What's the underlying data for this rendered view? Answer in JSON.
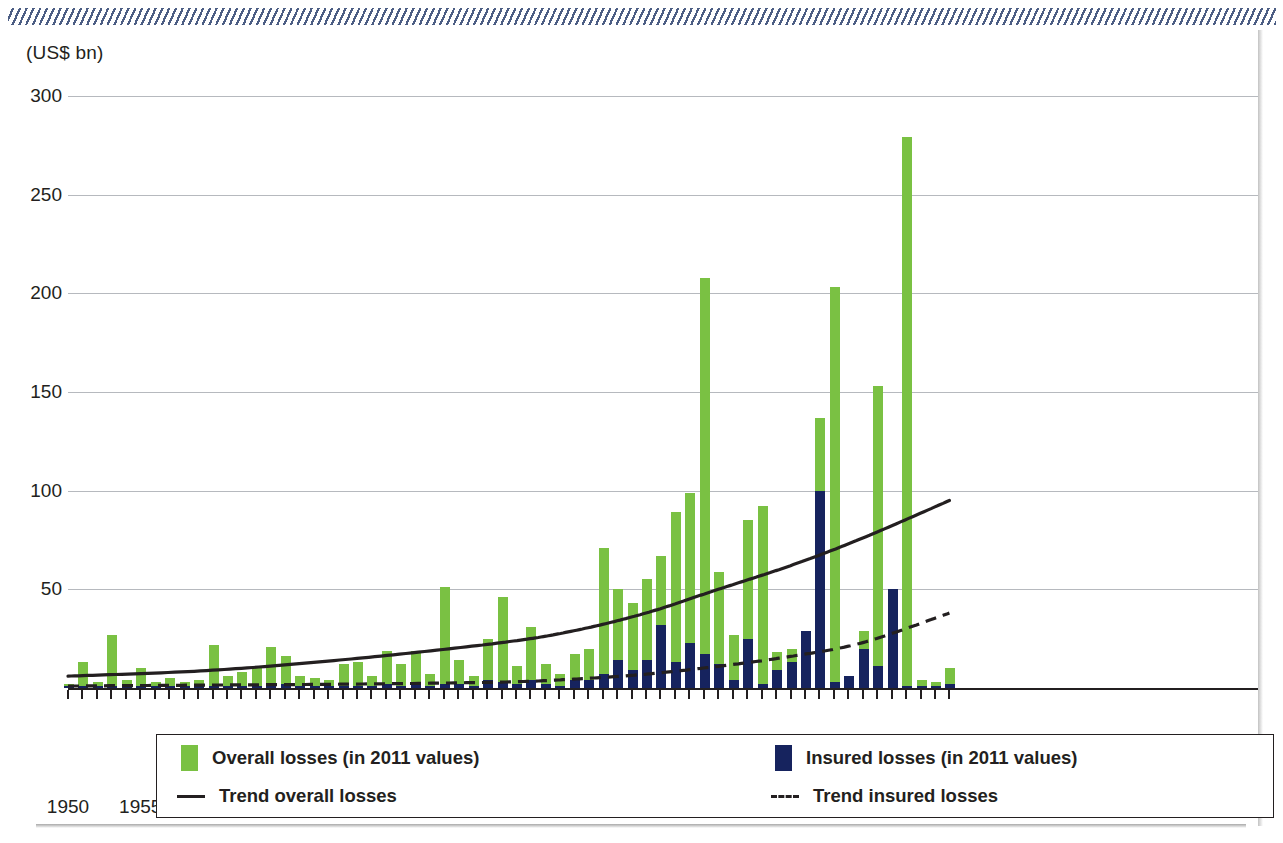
{
  "chart_data": {
    "type": "bar",
    "title": "",
    "subtitle": "",
    "xlabel": "",
    "ylabel": "(US$ bn)",
    "ylim": [
      0,
      300
    ],
    "xlim": [
      1950,
      2011
    ],
    "grid": true,
    "legend_position": "bottom",
    "y_ticks": [
      300,
      250,
      200,
      150,
      100,
      50
    ],
    "x_ticks": [
      1950,
      1955,
      1960,
      1965,
      1970,
      1975,
      1980,
      1985,
      1990,
      1995,
      2000,
      2005,
      2010
    ],
    "categories": [
      1950,
      1951,
      1952,
      1953,
      1954,
      1955,
      1956,
      1957,
      1958,
      1959,
      1960,
      1961,
      1962,
      1963,
      1964,
      1965,
      1966,
      1967,
      1968,
      1969,
      1970,
      1971,
      1972,
      1973,
      1974,
      1975,
      1976,
      1977,
      1978,
      1979,
      1980,
      1981,
      1982,
      1983,
      1984,
      1985,
      1986,
      1987,
      1988,
      1989,
      1990,
      1991,
      1992,
      1993,
      1994,
      1995,
      1996,
      1997,
      1998,
      1999,
      2000,
      2001,
      2002,
      2003,
      2004,
      2005,
      2006,
      2007,
      2008,
      2009,
      2010,
      2011
    ],
    "series": [
      {
        "name": "Overall losses (in 2011 values)",
        "color": "#7ac143",
        "values": [
          2,
          13,
          3,
          27,
          4,
          10,
          2,
          5,
          3,
          4,
          22,
          5,
          8,
          4,
          21,
          15,
          5,
          4,
          3,
          4,
          11,
          5,
          19,
          12,
          18,
          6,
          51,
          14,
          5,
          25,
          46,
          10,
          31,
          11,
          6,
          17,
          19,
          71,
          50,
          43,
          55,
          67,
          89,
          99,
          208,
          59,
          27,
          85,
          92,
          18,
          20,
          29,
          137,
          203,
          5,
          29,
          153,
          50,
          279,
          3,
          2,
          9
        ]
      },
      {
        "name": "Insured losses (in 2011 values)",
        "color": "#16235e",
        "values": [
          0,
          1,
          0,
          1,
          0,
          1,
          0,
          0,
          0,
          0,
          1,
          0,
          1,
          0,
          2,
          1,
          0,
          0,
          0,
          0,
          1,
          0,
          2,
          1,
          2,
          0,
          2,
          1,
          0,
          2,
          3,
          1,
          3,
          1,
          0,
          2,
          2,
          6,
          13,
          9,
          13,
          31,
          12,
          22,
          16,
          11,
          4,
          24,
          1,
          8,
          13,
          45,
          100,
          2,
          14,
          20,
          11,
          63,
          0,
          0,
          1,
          2
        ]
      }
    ],
    "series_note": "values are paired per category in categories order; insured is a sub-portion drawn inside the overall bar",
    "bars": [
      {
        "year": 1950,
        "overall": 2,
        "insured": 0
      },
      {
        "year": 1951,
        "overall": 13,
        "insured": 1
      },
      {
        "year": 1952,
        "overall": 3,
        "insured": 0
      },
      {
        "year": 1953,
        "overall": 27,
        "insured": 1
      },
      {
        "year": 1954,
        "overall": 4,
        "insured": 0
      },
      {
        "year": 1955,
        "overall": 10,
        "insured": 1
      },
      {
        "year": 1956,
        "overall": 2,
        "insured": 0
      },
      {
        "year": 1957,
        "overall": 5,
        "insured": 0
      },
      {
        "year": 1958,
        "overall": 3,
        "insured": 0
      },
      {
        "year": 1959,
        "overall": 4,
        "insured": 0
      },
      {
        "year": 1960,
        "overall": 22,
        "insured": 1
      },
      {
        "year": 1961,
        "overall": 5,
        "insured": 0
      },
      {
        "year": 1962,
        "overall": 8,
        "insured": 1
      },
      {
        "year": 1963,
        "overall": 10,
        "insured": 0
      },
      {
        "year": 1964,
        "overall": 21,
        "insured": 2
      },
      {
        "year": 1965,
        "overall": 16,
        "insured": 1
      },
      {
        "year": 1966,
        "overall": 5,
        "insured": 0
      },
      {
        "year": 1967,
        "overall": 4,
        "insured": 0
      },
      {
        "year": 1968,
        "overall": 3,
        "insured": 0
      },
      {
        "year": 1969,
        "overall": 11,
        "insured": 1
      },
      {
        "year": 1970,
        "overall": 12,
        "insured": 1
      },
      {
        "year": 1971,
        "overall": 5,
        "insured": 0
      },
      {
        "year": 1972,
        "overall": 19,
        "insured": 2
      },
      {
        "year": 1973,
        "overall": 12,
        "insured": 1
      },
      {
        "year": 1974,
        "overall": 19,
        "insured": 2
      },
      {
        "year": 1975,
        "overall": 6,
        "insured": 0
      },
      {
        "year": 1976,
        "overall": 51,
        "insured": 2
      },
      {
        "year": 1977,
        "overall": 14,
        "insured": 1
      },
      {
        "year": 1978,
        "overall": 5,
        "insured": 0
      },
      {
        "year": 1979,
        "overall": 25,
        "insured": 4
      },
      {
        "year": 1980,
        "overall": 46,
        "insured": 3
      },
      {
        "year": 1981,
        "overall": 10,
        "insured": 1
      },
      {
        "year": 1982,
        "overall": 31,
        "insured": 3
      },
      {
        "year": 1983,
        "overall": 12,
        "insured": 2
      },
      {
        "year": 1984,
        "overall": 6,
        "insured": 1
      },
      {
        "year": 1985,
        "overall": 17,
        "insured": 3
      },
      {
        "year": 1986,
        "overall": 19,
        "insured": 3
      },
      {
        "year": 1987,
        "overall": 71,
        "insured": 6
      },
      {
        "year": 1988,
        "overall": 50,
        "insured": 13
      },
      {
        "year": 1989,
        "overall": 43,
        "insured": 9
      },
      {
        "year": 1990,
        "overall": 55,
        "insured": 13
      },
      {
        "year": 1991,
        "overall": 67,
        "insured": 31
      },
      {
        "year": 1992,
        "overall": 89,
        "insured": 12
      },
      {
        "year": 1993,
        "overall": 99,
        "insured": 22
      },
      {
        "year": 1994,
        "overall": 208,
        "insured": 16
      },
      {
        "year": 1995,
        "overall": 59,
        "insured": 11
      },
      {
        "year": 1996,
        "overall": 27,
        "insured": 4
      },
      {
        "year": 1997,
        "overall": 85,
        "insured": 24
      },
      {
        "year": 1998,
        "overall": 92,
        "insured": 1
      },
      {
        "year": 1999,
        "overall": 18,
        "insured": 8
      },
      {
        "year": 2000,
        "overall": 20,
        "insured": 13
      },
      {
        "year": 2001,
        "overall": 29,
        "insured": 45
      },
      {
        "year": 2002,
        "overall": 137,
        "insured": 100
      },
      {
        "year": 2003,
        "overall": 203,
        "insured": 2
      },
      {
        "year": 2004,
        "overall": 5,
        "insured": 14
      },
      {
        "year": 2005,
        "overall": 29,
        "insured": 20
      },
      {
        "year": 2006,
        "overall": 153,
        "insured": 11
      },
      {
        "year": 2007,
        "overall": 50,
        "insured": 63
      },
      {
        "year": 2008,
        "overall": 279,
        "insured": 0
      },
      {
        "year": 2009,
        "overall": 3,
        "insured": 0
      },
      {
        "year": 2010,
        "overall": 2,
        "insured": 1
      },
      {
        "year": 2011,
        "overall": 9,
        "insured": 2
      }
    ],
    "plotted_bars": [
      {
        "year": 1950,
        "overall": 2,
        "insured": 1
      },
      {
        "year": 1951,
        "overall": 13,
        "insured": 1
      },
      {
        "year": 1952,
        "overall": 3,
        "insured": 1
      },
      {
        "year": 1953,
        "overall": 27,
        "insured": 1
      },
      {
        "year": 1954,
        "overall": 4,
        "insured": 1
      },
      {
        "year": 1955,
        "overall": 10,
        "insured": 1
      },
      {
        "year": 1956,
        "overall": 3,
        "insured": 1
      },
      {
        "year": 1957,
        "overall": 5,
        "insured": 1
      },
      {
        "year": 1958,
        "overall": 3,
        "insured": 1
      },
      {
        "year": 1959,
        "overall": 4,
        "insured": 1
      },
      {
        "year": 1960,
        "overall": 22,
        "insured": 1
      },
      {
        "year": 1961,
        "overall": 6,
        "insured": 1
      },
      {
        "year": 1962,
        "overall": 8,
        "insured": 1
      },
      {
        "year": 1963,
        "overall": 11,
        "insured": 1
      },
      {
        "year": 1964,
        "overall": 21,
        "insured": 2
      },
      {
        "year": 1965,
        "overall": 16,
        "insured": 2
      },
      {
        "year": 1966,
        "overall": 6,
        "insured": 1
      },
      {
        "year": 1967,
        "overall": 5,
        "insured": 1
      },
      {
        "year": 1968,
        "overall": 4,
        "insured": 1
      },
      {
        "year": 1969,
        "overall": 12,
        "insured": 1
      },
      {
        "year": 1970,
        "overall": 13,
        "insured": 1
      },
      {
        "year": 1971,
        "overall": 6,
        "insured": 1
      },
      {
        "year": 1972,
        "overall": 19,
        "insured": 2
      },
      {
        "year": 1973,
        "overall": 12,
        "insured": 1
      },
      {
        "year": 1974,
        "overall": 19,
        "insured": 3
      },
      {
        "year": 1975,
        "overall": 7,
        "insured": 1
      },
      {
        "year": 1976,
        "overall": 51,
        "insured": 2
      },
      {
        "year": 1977,
        "overall": 14,
        "insured": 2
      },
      {
        "year": 1978,
        "overall": 6,
        "insured": 1
      },
      {
        "year": 1979,
        "overall": 25,
        "insured": 4
      },
      {
        "year": 1980,
        "overall": 46,
        "insured": 3
      },
      {
        "year": 1981,
        "overall": 11,
        "insured": 2
      },
      {
        "year": 1982,
        "overall": 31,
        "insured": 4
      },
      {
        "year": 1983,
        "overall": 12,
        "insured": 2
      },
      {
        "year": 1984,
        "overall": 7,
        "insured": 1
      },
      {
        "year": 1985,
        "overall": 17,
        "insured": 4
      },
      {
        "year": 1986,
        "overall": 20,
        "insured": 4
      },
      {
        "year": 1987,
        "overall": 71,
        "insured": 7
      },
      {
        "year": 1988,
        "overall": 50,
        "insured": 14
      },
      {
        "year": 1989,
        "overall": 43,
        "insured": 9
      },
      {
        "year": 1990,
        "overall": 55,
        "insured": 14
      },
      {
        "year": 1991,
        "overall": 67,
        "insured": 32
      },
      {
        "year": 1992,
        "overall": 89,
        "insured": 13
      },
      {
        "year": 1993,
        "overall": 99,
        "insured": 23
      },
      {
        "year": 1994,
        "overall": 208,
        "insured": 17
      },
      {
        "year": 1995,
        "overall": 59,
        "insured": 12
      },
      {
        "year": 1996,
        "overall": 27,
        "insured": 4
      },
      {
        "year": 1997,
        "overall": 85,
        "insured": 25
      },
      {
        "year": 1998,
        "overall": 92,
        "insured": 2
      },
      {
        "year": 1999,
        "overall": 18,
        "insured": 9
      },
      {
        "year": 2000,
        "overall": 20,
        "insured": 13
      },
      {
        "year": 2001,
        "overall": 29,
        "insured": 45
      },
      {
        "year": 2002,
        "overall": 137,
        "insured": 100
      },
      {
        "year": 2003,
        "overall": 203,
        "insured": 3
      },
      {
        "year": 2004,
        "overall": 6,
        "insured": 15
      },
      {
        "year": 2005,
        "overall": 29,
        "insured": 20
      },
      {
        "year": 2006,
        "overall": 153,
        "insured": 11
      },
      {
        "year": 2007,
        "overall": 50,
        "insured": 63
      },
      {
        "year": 2008,
        "overall": 279,
        "insured": 1
      },
      {
        "year": 2009,
        "overall": 4,
        "insured": 1
      },
      {
        "year": 2010,
        "overall": 3,
        "insured": 1
      },
      {
        "year": 2011,
        "overall": 10,
        "insured": 2
      }
    ],
    "trend_overall": {
      "name": "Trend overall losses",
      "style": "solid",
      "color": "#231f20",
      "points": [
        [
          1950,
          6
        ],
        [
          1960,
          9
        ],
        [
          1970,
          15
        ],
        [
          1980,
          23
        ],
        [
          1985,
          29
        ],
        [
          1990,
          38
        ],
        [
          1995,
          50
        ],
        [
          2000,
          62
        ],
        [
          2005,
          76
        ],
        [
          2011,
          95
        ]
      ]
    },
    "trend_insured": {
      "name": "Trend insured losses",
      "style": "dashed",
      "color": "#231f20",
      "points": [
        [
          1950,
          1
        ],
        [
          1960,
          1.5
        ],
        [
          1970,
          2
        ],
        [
          1980,
          3
        ],
        [
          1985,
          4.5
        ],
        [
          1990,
          7
        ],
        [
          1995,
          11
        ],
        [
          2000,
          16
        ],
        [
          2005,
          23
        ],
        [
          2011,
          38
        ]
      ]
    }
  },
  "legend": {
    "items": [
      {
        "key": "overall-losses",
        "label": "Overall losses (in 2011 values)",
        "swatch": "green-square",
        "color": "#7ac143"
      },
      {
        "key": "insured-losses",
        "label": "Insured losses (in 2011 values)",
        "swatch": "navy-square",
        "color": "#16235e"
      },
      {
        "key": "trend-overall",
        "label": "Trend overall losses",
        "swatch": "solid-line",
        "color": "#231f20"
      },
      {
        "key": "trend-insured",
        "label": "Trend insured losses",
        "swatch": "dashed-line",
        "color": "#231f20"
      }
    ]
  },
  "axis": {
    "y_unit": "(US$ bn)"
  }
}
